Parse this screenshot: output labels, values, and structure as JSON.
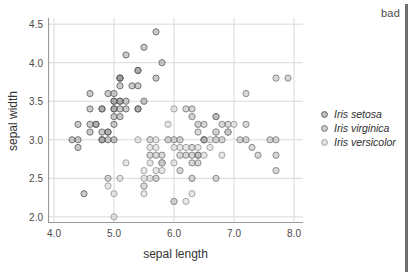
{
  "annotation": {
    "text": "bad",
    "rule_color": "#6e6e6e"
  },
  "chart_data": {
    "type": "scatter",
    "title": "",
    "xlabel": "sepal length",
    "ylabel": "sepal width",
    "xlim": [
      3.9,
      8.15
    ],
    "ylim": [
      1.92,
      4.58
    ],
    "xticks": [
      "4.0",
      "5.0",
      "6.0",
      "7.0",
      "8.0"
    ],
    "xtick_values": [
      4.0,
      5.0,
      6.0,
      7.0,
      8.0
    ],
    "yticks": [
      "2.0",
      "2.5",
      "3.0",
      "3.5",
      "4.0",
      "4.5"
    ],
    "ytick_values": [
      2.0,
      2.5,
      3.0,
      3.5,
      4.0,
      4.5
    ],
    "grid": true,
    "grid_color": "#d8d8d8",
    "axis_color": "#9a9a9a",
    "legend_position": "right",
    "marker": {
      "shape": "circle",
      "radius_px": 3.1,
      "stroke_width": 1.0
    },
    "series": [
      {
        "name": "Iris setosa",
        "fill": "#8f8f8f",
        "stroke": "#5c5c5c",
        "opacity": 0.85,
        "points": [
          [
            5.1,
            3.5
          ],
          [
            4.9,
            3.0
          ],
          [
            4.7,
            3.2
          ],
          [
            4.6,
            3.1
          ],
          [
            5.0,
            3.6
          ],
          [
            5.4,
            3.9
          ],
          [
            4.6,
            3.4
          ],
          [
            5.0,
            3.4
          ],
          [
            4.4,
            2.9
          ],
          [
            4.9,
            3.1
          ],
          [
            5.4,
            3.7
          ],
          [
            4.8,
            3.4
          ],
          [
            4.8,
            3.0
          ],
          [
            4.3,
            3.0
          ],
          [
            5.8,
            4.0
          ],
          [
            5.7,
            4.4
          ],
          [
            5.4,
            3.9
          ],
          [
            5.1,
            3.5
          ],
          [
            5.7,
            3.8
          ],
          [
            5.1,
            3.8
          ],
          [
            5.4,
            3.4
          ],
          [
            5.1,
            3.7
          ],
          [
            4.6,
            3.6
          ],
          [
            5.1,
            3.3
          ],
          [
            4.8,
            3.4
          ],
          [
            5.0,
            3.0
          ],
          [
            5.0,
            3.4
          ],
          [
            5.2,
            3.5
          ],
          [
            5.2,
            3.4
          ],
          [
            4.7,
            3.2
          ],
          [
            4.8,
            3.1
          ],
          [
            5.4,
            3.4
          ],
          [
            5.2,
            4.1
          ],
          [
            5.5,
            4.2
          ],
          [
            4.9,
            3.1
          ],
          [
            5.0,
            3.2
          ],
          [
            5.5,
            3.5
          ],
          [
            4.9,
            3.6
          ],
          [
            4.4,
            3.0
          ],
          [
            5.1,
            3.4
          ],
          [
            5.0,
            3.5
          ],
          [
            4.5,
            2.3
          ],
          [
            4.4,
            3.2
          ],
          [
            5.0,
            3.5
          ],
          [
            5.1,
            3.8
          ],
          [
            4.8,
            3.0
          ],
          [
            5.1,
            3.8
          ],
          [
            4.6,
            3.2
          ],
          [
            5.3,
            3.7
          ],
          [
            5.0,
            3.3
          ]
        ]
      },
      {
        "name": "Iris virginica",
        "fill": "#a8a8a8",
        "stroke": "#6f6f6f",
        "opacity": 0.8,
        "points": [
          [
            6.3,
            3.3
          ],
          [
            5.8,
            2.7
          ],
          [
            7.1,
            3.0
          ],
          [
            6.3,
            2.9
          ],
          [
            6.5,
            3.0
          ],
          [
            7.6,
            3.0
          ],
          [
            4.9,
            2.5
          ],
          [
            7.3,
            2.9
          ],
          [
            6.7,
            2.5
          ],
          [
            7.2,
            3.6
          ],
          [
            6.5,
            3.2
          ],
          [
            6.4,
            2.7
          ],
          [
            6.8,
            3.0
          ],
          [
            5.7,
            2.5
          ],
          [
            5.8,
            2.8
          ],
          [
            6.4,
            3.2
          ],
          [
            6.5,
            3.0
          ],
          [
            7.7,
            3.8
          ],
          [
            7.7,
            2.6
          ],
          [
            6.0,
            2.2
          ],
          [
            6.9,
            3.2
          ],
          [
            5.6,
            2.8
          ],
          [
            7.7,
            2.8
          ],
          [
            6.3,
            2.7
          ],
          [
            6.7,
            3.3
          ],
          [
            7.2,
            3.2
          ],
          [
            6.2,
            2.8
          ],
          [
            6.1,
            3.0
          ],
          [
            6.4,
            2.8
          ],
          [
            7.2,
            3.0
          ],
          [
            7.4,
            2.8
          ],
          [
            7.9,
            3.8
          ],
          [
            6.4,
            2.8
          ],
          [
            6.3,
            2.8
          ],
          [
            6.1,
            2.6
          ],
          [
            7.7,
            3.0
          ],
          [
            6.3,
            3.4
          ],
          [
            6.4,
            3.1
          ],
          [
            6.0,
            3.0
          ],
          [
            6.9,
            3.1
          ],
          [
            6.7,
            3.1
          ],
          [
            6.9,
            3.1
          ],
          [
            5.8,
            2.7
          ],
          [
            6.8,
            3.2
          ],
          [
            6.7,
            3.3
          ],
          [
            6.7,
            3.0
          ],
          [
            6.3,
            2.5
          ],
          [
            6.5,
            3.0
          ],
          [
            6.2,
            3.4
          ],
          [
            5.9,
            3.0
          ]
        ]
      },
      {
        "name": "Iris versicolor",
        "fill": "#d0d0d0",
        "stroke": "#9c9c9c",
        "opacity": 0.9,
        "points": [
          [
            7.0,
            3.2
          ],
          [
            6.4,
            3.2
          ],
          [
            6.9,
            3.1
          ],
          [
            5.5,
            2.3
          ],
          [
            6.5,
            2.8
          ],
          [
            5.7,
            2.8
          ],
          [
            6.3,
            3.3
          ],
          [
            4.9,
            2.4
          ],
          [
            6.6,
            2.9
          ],
          [
            5.2,
            2.7
          ],
          [
            5.0,
            2.0
          ],
          [
            5.9,
            3.0
          ],
          [
            6.0,
            2.2
          ],
          [
            6.1,
            2.9
          ],
          [
            5.6,
            2.9
          ],
          [
            6.7,
            3.1
          ],
          [
            5.6,
            3.0
          ],
          [
            5.8,
            2.7
          ],
          [
            6.2,
            2.2
          ],
          [
            5.6,
            2.5
          ],
          [
            5.9,
            3.2
          ],
          [
            6.1,
            2.8
          ],
          [
            6.3,
            2.5
          ],
          [
            6.1,
            2.8
          ],
          [
            6.4,
            2.9
          ],
          [
            6.6,
            3.0
          ],
          [
            6.8,
            2.8
          ],
          [
            6.7,
            3.0
          ],
          [
            6.0,
            2.9
          ],
          [
            5.7,
            2.6
          ],
          [
            5.5,
            2.4
          ],
          [
            5.5,
            2.4
          ],
          [
            5.8,
            2.7
          ],
          [
            6.0,
            2.7
          ],
          [
            5.4,
            3.0
          ],
          [
            6.0,
            3.4
          ],
          [
            6.7,
            3.1
          ],
          [
            6.3,
            2.3
          ],
          [
            5.6,
            3.0
          ],
          [
            5.5,
            2.5
          ],
          [
            5.5,
            2.6
          ],
          [
            6.1,
            3.0
          ],
          [
            5.8,
            2.6
          ],
          [
            5.0,
            2.3
          ],
          [
            5.6,
            2.7
          ],
          [
            5.7,
            3.0
          ],
          [
            5.7,
            2.9
          ],
          [
            6.2,
            2.9
          ],
          [
            5.1,
            2.5
          ],
          [
            5.7,
            2.8
          ]
        ]
      }
    ]
  }
}
